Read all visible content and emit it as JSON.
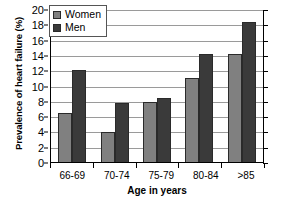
{
  "chart_data": {
    "type": "bar",
    "title": "",
    "categories": [
      "66-69",
      "70-74",
      "75-79",
      "80-84",
      ">85"
    ],
    "series": [
      {
        "name": "Women",
        "color": "#808080",
        "values": [
          6.5,
          4.1,
          8.0,
          11.1,
          14.3
        ]
      },
      {
        "name": "Men",
        "color": "#3a3a3a",
        "values": [
          12.1,
          7.8,
          8.5,
          14.2,
          18.4
        ]
      }
    ],
    "xlabel": "Age in years",
    "ylabel": "Prevalence of heart failure (%)",
    "ylim": [
      0,
      20
    ],
    "ytick_step": 2,
    "yticks": [
      0,
      2,
      4,
      6,
      8,
      10,
      12,
      14,
      16,
      18,
      20
    ],
    "ytick_labels": [
      "0",
      "2",
      "4",
      "6",
      "8",
      "10",
      "12",
      "14",
      "16",
      "18",
      "20"
    ],
    "grid": true,
    "legend_position": "top-left-inside",
    "legend_entries": [
      "Women",
      "Men"
    ]
  }
}
